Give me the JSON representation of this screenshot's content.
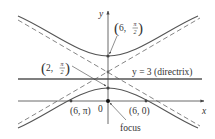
{
  "diagram": {
    "axes": {
      "x_label": "x",
      "y_label": "y",
      "origin_label": "0"
    },
    "directrix": {
      "label": "y = 3 (directrix)",
      "equation": "y = 3"
    },
    "points": [
      {
        "label": "(6, π/2)",
        "coord_text": "6,",
        "numerator": "π",
        "denominator": "2",
        "role": "upper-vertex"
      },
      {
        "label": "(2, π/2)",
        "coord_text": "2,",
        "numerator": "π",
        "denominator": "2",
        "role": "lower-vertex"
      },
      {
        "label": "(6, π)",
        "role": "x-intercept-left"
      },
      {
        "label": "(6, 0)",
        "role": "x-intercept-right"
      }
    ],
    "focus_label": "focus",
    "colors": {
      "curve": "#555555",
      "axis": "#444444",
      "directrix": "#555555",
      "asymptote": "#777777",
      "text": "#333333"
    }
  }
}
